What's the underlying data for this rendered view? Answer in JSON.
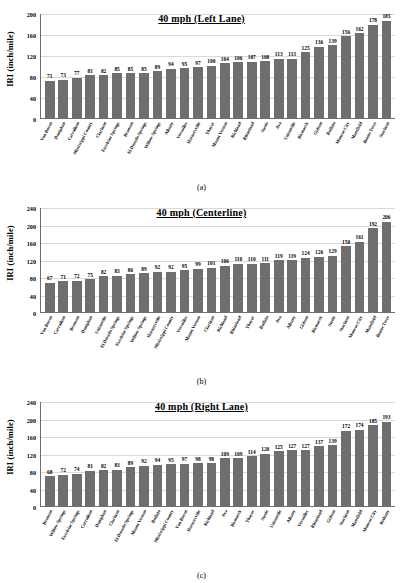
{
  "figure": {
    "captions": [
      "(a)",
      "(b)",
      "(c)"
    ],
    "y_axis_label": "IRI (inch/mile)",
    "bar_color": "#6e6e6e",
    "grid_color": "#d9d9d9",
    "axis_color": "#6f6f6f"
  },
  "chart_data": [
    {
      "type": "bar",
      "title": "40 mph (Left Lane)",
      "caption": "(a)",
      "xlabel": "",
      "ylabel": "IRI (inch/mile)",
      "ylim": [
        0,
        200
      ],
      "yticks": [
        0,
        40,
        80,
        120,
        160,
        200
      ],
      "grid": true,
      "legend": "none",
      "categories": [
        "Van Buren",
        "Doniphan",
        "Carrollton",
        "Mississippi County",
        "Clarkton",
        "Excelsior Springs",
        "Branson",
        "El Dorado Springs",
        "Willow Springs",
        "Albany",
        "Versailles",
        "Hornersville",
        "Thayer",
        "Mount Vernon",
        "Richland",
        "Rhineland",
        "Steele",
        "Ava",
        "Unionville",
        "Bismarck",
        "Gideon",
        "Buffalo",
        "Monroe City",
        "Mansfield",
        "Bonne Terre",
        "Stockton"
      ],
      "values": [
        71,
        73,
        77,
        81,
        82,
        85,
        85,
        85,
        89,
        94,
        95,
        97,
        100,
        104,
        106,
        107,
        108,
        113,
        113,
        125,
        136,
        139,
        156,
        162,
        178,
        185
      ]
    },
    {
      "type": "bar",
      "title": "40 mph (Centerline)",
      "caption": "(b)",
      "xlabel": "",
      "ylabel": "IRI (inch/mile)",
      "ylim": [
        0,
        240
      ],
      "yticks": [
        0,
        40,
        80,
        120,
        160,
        200,
        240
      ],
      "grid": true,
      "legend": "none",
      "categories": [
        "Van Buren",
        "Carrollton",
        "Branson",
        "Doniphan",
        "Unionville",
        "El Dorado Springs",
        "Excelsior Springs",
        "Willow Springs",
        "Hornersville",
        "Mississippi County",
        "Versailles",
        "Mount Vernon",
        "Clarkton",
        "Richland",
        "Rhineland",
        "Thayer",
        "Buffalo",
        "Ava",
        "Albany",
        "Gideon",
        "Bismarck",
        "Steele",
        "Stockton",
        "Monroe City",
        "Mansfield",
        "Bonne Terre"
      ],
      "values": [
        67,
        71,
        72,
        75,
        82,
        83,
        86,
        89,
        92,
        92,
        95,
        99,
        101,
        106,
        110,
        110,
        111,
        119,
        119,
        124,
        126,
        129,
        150,
        161,
        192,
        206
      ]
    },
    {
      "type": "bar",
      "title": "40 mph (Right Lane)",
      "caption": "(c)",
      "xlabel": "",
      "ylabel": "IRI (inch/mile)",
      "ylim": [
        0,
        240
      ],
      "yticks": [
        0,
        40,
        80,
        120,
        160,
        200,
        240
      ],
      "grid": true,
      "legend": "none",
      "categories": [
        "Branson",
        "Willow Springs",
        "Excelsior Springs",
        "Carrollton",
        "Doniphan",
        "Clarkton",
        "El Dorado Springs",
        "Mount Vernon",
        "Buffalo",
        "Mississippi County",
        "Van Buren",
        "Hornersville",
        "Richland",
        "Ava",
        "Bismarck",
        "Thayer",
        "Steele",
        "Unionville",
        "Albany",
        "Versailles",
        "Rhineland",
        "Gideon",
        "Stockton",
        "Mansfield",
        "Monroe City",
        "Bethany"
      ],
      "values": [
        68,
        72,
        74,
        81,
        82,
        83,
        89,
        92,
        94,
        95,
        97,
        98,
        98,
        109,
        109,
        114,
        120,
        125,
        127,
        127,
        137,
        139,
        172,
        174,
        185,
        193
      ]
    }
  ]
}
